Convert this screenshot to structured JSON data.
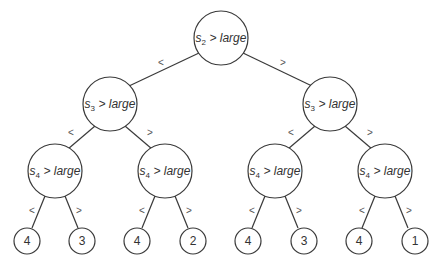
{
  "diagram": {
    "type": "decision-tree",
    "root": {
      "var": "s",
      "sub": "2",
      "rest": " > large"
    },
    "level2": [
      {
        "var": "s",
        "sub": "3",
        "rest": " > large"
      },
      {
        "var": "s",
        "sub": "3",
        "rest": " > large"
      }
    ],
    "level3": [
      {
        "var": "s",
        "sub": "4",
        "rest": " > large"
      },
      {
        "var": "s",
        "sub": "4",
        "rest": " > large"
      },
      {
        "var": "s",
        "sub": "4",
        "rest": " > large"
      },
      {
        "var": "s",
        "sub": "4",
        "rest": " > large"
      }
    ],
    "leaves": [
      "4",
      "3",
      "4",
      "2",
      "4",
      "3",
      "4",
      "1"
    ],
    "edge_labels": {
      "left": "<",
      "right": ">"
    }
  }
}
